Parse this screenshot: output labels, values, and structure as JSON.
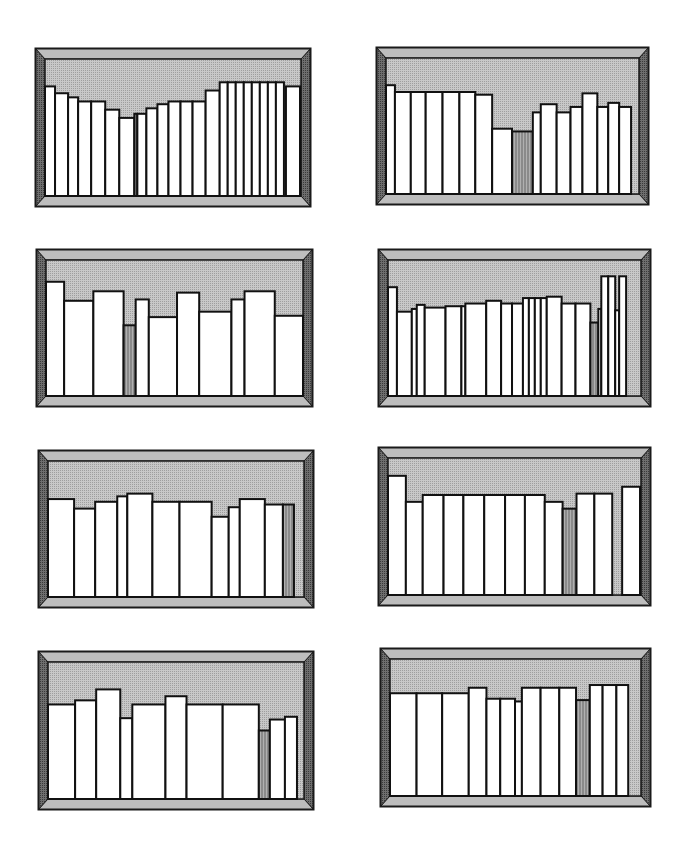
{
  "page": {
    "background": "#ffffff"
  },
  "colors": {
    "frame_outer": "#1a1a1a",
    "bevel_top": "#bdbdbd",
    "bevel_side": "#6e6e6e",
    "back_wall": "#c8c8c8",
    "book_fill": "#ffffff",
    "book_stroke": "#111111",
    "gray_book": "#8a8a8a"
  },
  "shelves": [
    {
      "id": 1,
      "x": 35,
      "y": 48,
      "w": 276,
      "h": 159,
      "books": [
        [
          0,
          10,
          0.8
        ],
        [
          10,
          13,
          0.75
        ],
        [
          23,
          10,
          0.72
        ],
        [
          33,
          13,
          0.69
        ],
        [
          46,
          14,
          0.69
        ],
        [
          60,
          14,
          0.63
        ],
        [
          74,
          15,
          0.57
        ],
        [
          89,
          3,
          0.6,
          "g"
        ],
        [
          92,
          9,
          0.6
        ],
        [
          101,
          11,
          0.64
        ],
        [
          112,
          11,
          0.67
        ],
        [
          123,
          12,
          0.69
        ],
        [
          135,
          12,
          0.69
        ],
        [
          147,
          13,
          0.69
        ],
        [
          160,
          14,
          0.77
        ],
        [
          174,
          8,
          0.83
        ],
        [
          182,
          8,
          0.83
        ],
        [
          190,
          8,
          0.83
        ],
        [
          198,
          8,
          0.83
        ],
        [
          206,
          8,
          0.83
        ],
        [
          214,
          8,
          0.83
        ],
        [
          222,
          8,
          0.83
        ],
        [
          230,
          8,
          0.83
        ],
        [
          240,
          14,
          0.8
        ]
      ]
    },
    {
      "id": 2,
      "x": 376,
      "y": 47,
      "w": 273,
      "h": 158,
      "books": [
        [
          0,
          9,
          0.8
        ],
        [
          9,
          16,
          0.75
        ],
        [
          25,
          15,
          0.75
        ],
        [
          40,
          17,
          0.75
        ],
        [
          57,
          17,
          0.75
        ],
        [
          74,
          16,
          0.75
        ],
        [
          90,
          17,
          0.73
        ],
        [
          107,
          20,
          0.48
        ],
        [
          127,
          21,
          0.46,
          "g"
        ],
        [
          148,
          8,
          0.6
        ],
        [
          156,
          16,
          0.66
        ],
        [
          172,
          14,
          0.6
        ],
        [
          186,
          12,
          0.64
        ],
        [
          198,
          15,
          0.74
        ],
        [
          213,
          11,
          0.64
        ],
        [
          224,
          11,
          0.67
        ],
        [
          235,
          12,
          0.64
        ]
      ]
    },
    {
      "id": 3,
      "x": 36,
      "y": 249,
      "w": 277,
      "h": 158,
      "books": [
        [
          0,
          18,
          0.84
        ],
        [
          18,
          29,
          0.7
        ],
        [
          47,
          30,
          0.77
        ],
        [
          77,
          12,
          0.52,
          "g"
        ],
        [
          89,
          13,
          0.71
        ],
        [
          102,
          28,
          0.58
        ],
        [
          130,
          22,
          0.76
        ],
        [
          152,
          32,
          0.62
        ],
        [
          184,
          13,
          0.71
        ],
        [
          197,
          30,
          0.77
        ],
        [
          227,
          28,
          0.59
        ]
      ]
    },
    {
      "id": 4,
      "x": 378,
      "y": 249,
      "w": 273,
      "h": 158,
      "books": [
        [
          0,
          9,
          0.8
        ],
        [
          9,
          15,
          0.62
        ],
        [
          24,
          5,
          0.64
        ],
        [
          29,
          8,
          0.67
        ],
        [
          37,
          21,
          0.65
        ],
        [
          58,
          16,
          0.66
        ],
        [
          74,
          4,
          0.66
        ],
        [
          78,
          21,
          0.68
        ],
        [
          99,
          15,
          0.7
        ],
        [
          114,
          11,
          0.68
        ],
        [
          125,
          11,
          0.68
        ],
        [
          136,
          6,
          0.72
        ],
        [
          142,
          6,
          0.72
        ],
        [
          148,
          6,
          0.72
        ],
        [
          154,
          6,
          0.72
        ],
        [
          160,
          15,
          0.73
        ],
        [
          175,
          14,
          0.68
        ],
        [
          189,
          15,
          0.68
        ],
        [
          204,
          8,
          0.54,
          "g"
        ],
        [
          212,
          3,
          0.64
        ],
        [
          215,
          7,
          0.88
        ],
        [
          222,
          7,
          0.88
        ],
        [
          229,
          4,
          0.63
        ],
        [
          233,
          7,
          0.88
        ]
      ]
    },
    {
      "id": 5,
      "x": 38,
      "y": 450,
      "w": 276,
      "h": 158,
      "books": [
        [
          0,
          26,
          0.72
        ],
        [
          26,
          21,
          0.65
        ],
        [
          47,
          22,
          0.7
        ],
        [
          69,
          10,
          0.74
        ],
        [
          79,
          25,
          0.76
        ],
        [
          104,
          27,
          0.7
        ],
        [
          131,
          32,
          0.7
        ],
        [
          163,
          17,
          0.59
        ],
        [
          180,
          11,
          0.66
        ],
        [
          191,
          25,
          0.72
        ],
        [
          216,
          18,
          0.68
        ],
        [
          234,
          11,
          0.68,
          "g"
        ]
      ]
    },
    {
      "id": 6,
      "x": 378,
      "y": 447,
      "w": 273,
      "h": 159,
      "books": [
        [
          0,
          18,
          0.87
        ],
        [
          18,
          17,
          0.68
        ],
        [
          35,
          21,
          0.73
        ],
        [
          56,
          20,
          0.73
        ],
        [
          76,
          21,
          0.73
        ],
        [
          97,
          21,
          0.73
        ],
        [
          118,
          20,
          0.73
        ],
        [
          138,
          20,
          0.73
        ],
        [
          158,
          18,
          0.68
        ],
        [
          176,
          14,
          0.63,
          "g"
        ],
        [
          190,
          18,
          0.74
        ],
        [
          208,
          18,
          0.74
        ],
        [
          226,
          10,
          0.0
        ],
        [
          236,
          18,
          0.79
        ]
      ]
    },
    {
      "id": 7,
      "x": 38,
      "y": 651,
      "w": 276,
      "h": 159,
      "books": [
        [
          0,
          27,
          0.69
        ],
        [
          27,
          21,
          0.72
        ],
        [
          48,
          24,
          0.8
        ],
        [
          72,
          12,
          0.59
        ],
        [
          84,
          33,
          0.69
        ],
        [
          117,
          21,
          0.75
        ],
        [
          138,
          36,
          0.69
        ],
        [
          174,
          36,
          0.69
        ],
        [
          210,
          11,
          0.5,
          "g"
        ],
        [
          221,
          15,
          0.58
        ],
        [
          236,
          12,
          0.6
        ]
      ]
    },
    {
      "id": 8,
      "x": 380,
      "y": 648,
      "w": 271,
      "h": 159,
      "books": [
        [
          0,
          27,
          0.75
        ],
        [
          27,
          26,
          0.75
        ],
        [
          53,
          27,
          0.75
        ],
        [
          80,
          18,
          0.79
        ],
        [
          98,
          14,
          0.71
        ],
        [
          112,
          15,
          0.71
        ],
        [
          127,
          7,
          0.69
        ],
        [
          134,
          19,
          0.79
        ],
        [
          153,
          19,
          0.79
        ],
        [
          172,
          17,
          0.79
        ],
        [
          189,
          14,
          0.7,
          "g"
        ],
        [
          203,
          13,
          0.81
        ],
        [
          216,
          14,
          0.81
        ],
        [
          230,
          12,
          0.81
        ]
      ]
    }
  ]
}
